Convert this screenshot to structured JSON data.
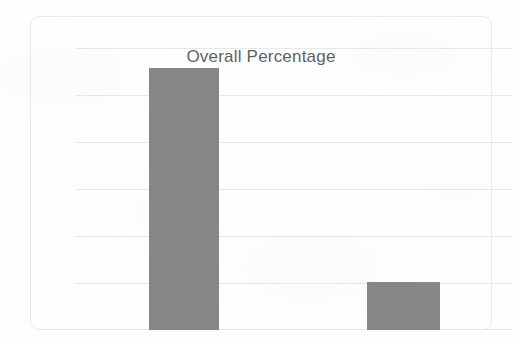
{
  "chart_data": {
    "type": "bar",
    "title": "Overall Percentage",
    "subtitle": "",
    "xlabel": "",
    "ylabel": "",
    "categories": [
      "Bar 1",
      "Bar 2"
    ],
    "values": [
      93,
      17
    ],
    "ylim": [
      0,
      100
    ],
    "yticks": [
      0,
      16.7,
      33.3,
      50,
      66.7,
      83.3,
      100
    ],
    "grid": true,
    "gridlines_count": 7,
    "legend": "none",
    "axis_tick_labels_visible": false,
    "series": [
      {
        "name": "Overall Percentage",
        "color": "#878787",
        "values": [
          93,
          17
        ]
      }
    ],
    "bars": [
      {
        "label": "Bar 1",
        "value": 93,
        "color": "#878787"
      },
      {
        "label": "Bar 2",
        "value": 17,
        "color": "#878787"
      }
    ]
  },
  "chart": {
    "title": "Overall Percentage",
    "bar_color": "#878787",
    "gridline_color": "#e6e7e9",
    "frame_border_color": "#e9eaec",
    "title_color": "#5f6164",
    "background_color": "#fefefe"
  }
}
